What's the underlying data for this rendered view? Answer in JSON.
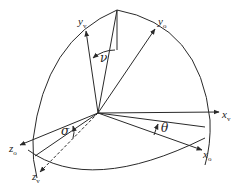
{
  "diagram": {
    "type": "coordinate-frame-rotation",
    "axes": [
      {
        "id": "y_v",
        "label": "y",
        "subscript": "v"
      },
      {
        "id": "y_o",
        "label": "y",
        "subscript": "o"
      },
      {
        "id": "x_v",
        "label": "x",
        "subscript": "v"
      },
      {
        "id": "x_o",
        "label": "x",
        "subscript": "o"
      },
      {
        "id": "z_o",
        "label": "z",
        "subscript": "o"
      },
      {
        "id": "z_v",
        "label": "z",
        "subscript": "v"
      }
    ],
    "angles": [
      {
        "id": "nu",
        "symbol": "ν",
        "between": [
          "y_o",
          "y_v"
        ]
      },
      {
        "id": "theta",
        "symbol": "θ",
        "between": [
          "x_v",
          "x_o"
        ]
      },
      {
        "id": "sigma",
        "symbol": "σ",
        "between": [
          "z_o",
          "z_v"
        ]
      }
    ],
    "colors": {
      "line": "#2a2a2a",
      "text": "#222222",
      "background": "#ffffff"
    }
  }
}
